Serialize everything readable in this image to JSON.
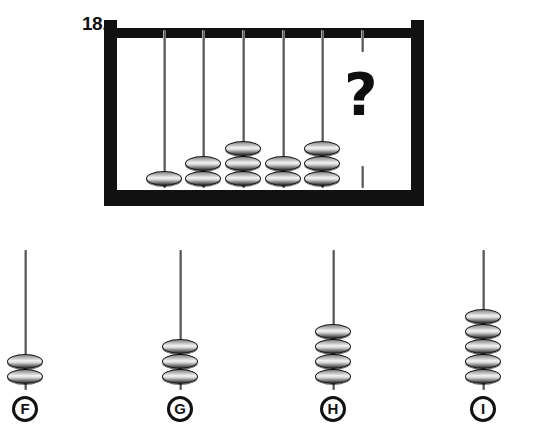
{
  "question": {
    "number": "18.",
    "unknown_marker": "?"
  },
  "colors": {
    "frame": "#121111",
    "bead_dark": "#2a2a2a",
    "bead_light": "#f2f2f2",
    "rod": "#6e6e6e",
    "text": "#100f0f",
    "background": "#ffffff"
  },
  "abacus": {
    "name": "main-abacus",
    "rod_count": 6,
    "rods": [
      {
        "index": 1,
        "bead_count": 1,
        "x": 164
      },
      {
        "index": 2,
        "bead_count": 2,
        "x": 203
      },
      {
        "index": 3,
        "bead_count": 3,
        "x": 243
      },
      {
        "index": 4,
        "bead_count": 2,
        "x": 283
      },
      {
        "index": 5,
        "bead_count": 3,
        "x": 322
      },
      {
        "index": 6,
        "bead_count": 0,
        "x": 362
      }
    ],
    "bead_counts": [
      1,
      2,
      3,
      2,
      3,
      0
    ],
    "frame": {
      "left": 104,
      "top": 20,
      "width": 320,
      "height": 186
    }
  },
  "options": [
    {
      "letter": "F",
      "bead_count": 2,
      "x": 25
    },
    {
      "letter": "G",
      "bead_count": 3,
      "x": 180
    },
    {
      "letter": "H",
      "bead_count": 4,
      "x": 333
    },
    {
      "letter": "I",
      "bead_count": 5,
      "x": 483
    }
  ]
}
